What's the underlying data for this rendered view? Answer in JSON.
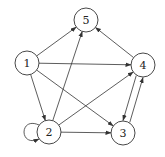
{
  "diagram": {
    "type": "directed-graph",
    "nodes": [
      {
        "id": "1",
        "label": "1",
        "x": 27,
        "y": 63
      },
      {
        "id": "2",
        "label": "2",
        "x": 49,
        "y": 132
      },
      {
        "id": "3",
        "label": "3",
        "x": 123,
        "y": 133
      },
      {
        "id": "4",
        "label": "4",
        "x": 143,
        "y": 65
      },
      {
        "id": "5",
        "label": "5",
        "x": 86,
        "y": 20
      }
    ],
    "edges": [
      {
        "from": "1",
        "to": "5"
      },
      {
        "from": "1",
        "to": "4"
      },
      {
        "from": "1",
        "to": "3"
      },
      {
        "from": "1",
        "to": "2"
      },
      {
        "from": "2",
        "to": "5"
      },
      {
        "from": "2",
        "to": "4"
      },
      {
        "from": "2",
        "to": "3"
      },
      {
        "from": "2",
        "to": "2",
        "self_loop": true
      },
      {
        "from": "4",
        "to": "5"
      },
      {
        "from": "4",
        "to": "3"
      },
      {
        "from": "3",
        "to": "4"
      }
    ]
  }
}
